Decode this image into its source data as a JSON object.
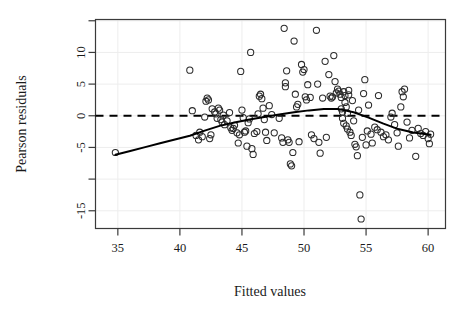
{
  "chart_data": {
    "type": "scatter",
    "title": "",
    "xlabel": "Fitted values",
    "ylabel": "Pearson residuals",
    "xlim": [
      33.2,
      61.4
    ],
    "ylim": [
      -17.8,
      15.2
    ],
    "xticks": [
      35,
      40,
      45,
      50,
      55,
      60
    ],
    "xtick_labels": [
      "35",
      "40",
      "45",
      "50",
      "55",
      "60"
    ],
    "yticks": [
      15,
      10,
      5,
      0,
      -5,
      -10,
      -15
    ],
    "ytick_labels": [
      "",
      "10",
      "5",
      "0",
      "-5",
      "",
      "-15"
    ],
    "grid": true,
    "legend": "none",
    "marker": "open-circle",
    "marker_color": "#2b2b2b",
    "reference_line": {
      "y": 0,
      "style": "dashed",
      "color": "#000000"
    },
    "smoother": {
      "name": "loess-smooth",
      "style": "solid",
      "color": "#000000",
      "x": [
        34.8,
        36.0,
        37.2,
        38.4,
        39.6,
        40.8,
        42.0,
        43.2,
        44.4,
        45.6,
        46.8,
        48.0,
        49.2,
        50.4,
        51.6,
        52.8,
        54.0,
        55.2,
        56.4,
        57.6,
        58.8,
        60.2
      ],
      "y": [
        -6.15,
        -5.55,
        -4.95,
        -4.35,
        -3.75,
        -3.15,
        -2.35,
        -1.6,
        -1.05,
        -0.6,
        -0.2,
        0.2,
        0.55,
        0.85,
        1.05,
        1.05,
        0.55,
        -0.3,
        -1.25,
        -2.1,
        -2.65,
        -3.0
      ]
    },
    "points": [
      [
        34.8,
        -5.8
      ],
      [
        40.8,
        7.2
      ],
      [
        41.0,
        0.8
      ],
      [
        41.3,
        -3.1
      ],
      [
        41.5,
        -3.8
      ],
      [
        41.6,
        -2.6
      ],
      [
        41.8,
        -3.3
      ],
      [
        42.0,
        -0.2
      ],
      [
        42.1,
        2.3
      ],
      [
        42.2,
        2.8
      ],
      [
        42.3,
        2.5
      ],
      [
        42.4,
        -3.6
      ],
      [
        42.5,
        -3.0
      ],
      [
        42.6,
        1.1
      ],
      [
        42.8,
        0.6
      ],
      [
        42.9,
        0.3
      ],
      [
        43.0,
        -0.4
      ],
      [
        43.1,
        1.2
      ],
      [
        43.2,
        0.9
      ],
      [
        43.3,
        -0.6
      ],
      [
        43.4,
        -1.0
      ],
      [
        43.5,
        0.1
      ],
      [
        43.6,
        -1.4
      ],
      [
        43.8,
        -0.8
      ],
      [
        44.0,
        0.5
      ],
      [
        44.1,
        -1.9
      ],
      [
        44.2,
        -2.3
      ],
      [
        44.3,
        -2.0
      ],
      [
        44.4,
        -1.5
      ],
      [
        44.6,
        -2.7
      ],
      [
        44.7,
        -4.3
      ],
      [
        44.8,
        -3.0
      ],
      [
        44.9,
        7.0
      ],
      [
        45.0,
        0.9
      ],
      [
        45.1,
        -0.3
      ],
      [
        45.2,
        -2.6
      ],
      [
        45.3,
        -2.4
      ],
      [
        45.4,
        -4.8
      ],
      [
        45.5,
        -1.1
      ],
      [
        45.6,
        -0.5
      ],
      [
        45.7,
        10.0
      ],
      [
        45.8,
        -5.2
      ],
      [
        45.9,
        -6.1
      ],
      [
        46.0,
        -2.8
      ],
      [
        46.2,
        -2.5
      ],
      [
        46.3,
        0.3
      ],
      [
        46.4,
        3.1
      ],
      [
        46.5,
        3.4
      ],
      [
        46.6,
        2.7
      ],
      [
        46.7,
        1.2
      ],
      [
        46.8,
        -0.6
      ],
      [
        46.9,
        -2.6
      ],
      [
        47.0,
        -3.9
      ],
      [
        47.2,
        1.6
      ],
      [
        47.4,
        0.2
      ],
      [
        47.6,
        -2.7
      ],
      [
        48.0,
        -0.4
      ],
      [
        48.2,
        -3.5
      ],
      [
        48.3,
        -4.2
      ],
      [
        48.4,
        13.8
      ],
      [
        48.5,
        5.2
      ],
      [
        48.5,
        4.6
      ],
      [
        48.6,
        7.1
      ],
      [
        48.7,
        -3.8
      ],
      [
        48.8,
        -4.2
      ],
      [
        48.9,
        -7.6
      ],
      [
        49.0,
        -7.9
      ],
      [
        49.1,
        -5.8
      ],
      [
        49.2,
        11.8
      ],
      [
        49.3,
        3.4
      ],
      [
        49.4,
        1.4
      ],
      [
        49.5,
        1.8
      ],
      [
        49.6,
        -4.1
      ],
      [
        49.8,
        8.1
      ],
      [
        49.9,
        6.9
      ],
      [
        50.0,
        7.3
      ],
      [
        50.1,
        3.0
      ],
      [
        50.2,
        2.5
      ],
      [
        50.3,
        4.9
      ],
      [
        50.5,
        2.9
      ],
      [
        50.6,
        -3.0
      ],
      [
        50.8,
        -3.6
      ],
      [
        51.0,
        13.5
      ],
      [
        51.1,
        5.0
      ],
      [
        51.2,
        -4.2
      ],
      [
        51.3,
        -5.9
      ],
      [
        51.5,
        2.8
      ],
      [
        51.7,
        8.6
      ],
      [
        51.8,
        -3.4
      ],
      [
        52.0,
        6.5
      ],
      [
        52.1,
        3.1
      ],
      [
        52.2,
        2.8
      ],
      [
        52.3,
        3.0
      ],
      [
        52.4,
        9.5
      ],
      [
        52.5,
        5.4
      ],
      [
        52.6,
        3.6
      ],
      [
        52.7,
        4.2
      ],
      [
        52.8,
        3.9
      ],
      [
        52.9,
        3.4
      ],
      [
        53.0,
        2.9
      ],
      [
        53.0,
        1.1
      ],
      [
        53.1,
        0.6
      ],
      [
        53.1,
        -0.4
      ],
      [
        53.2,
        -1.2
      ],
      [
        53.2,
        3.8
      ],
      [
        53.3,
        3.2
      ],
      [
        53.3,
        2.1
      ],
      [
        53.4,
        1.4
      ],
      [
        53.4,
        -1.6
      ],
      [
        53.5,
        -2.1
      ],
      [
        53.5,
        0.4
      ],
      [
        53.6,
        4.0
      ],
      [
        53.6,
        3.3
      ],
      [
        53.7,
        -2.6
      ],
      [
        53.8,
        -3.1
      ],
      [
        53.9,
        2.4
      ],
      [
        54.0,
        -0.8
      ],
      [
        54.1,
        -4.5
      ],
      [
        54.2,
        -4.9
      ],
      [
        54.3,
        -6.3
      ],
      [
        54.4,
        0.9
      ],
      [
        54.5,
        -12.5
      ],
      [
        54.6,
        -16.3
      ],
      [
        54.7,
        -3.4
      ],
      [
        54.8,
        3.5
      ],
      [
        54.9,
        5.7
      ],
      [
        55.0,
        -4.6
      ],
      [
        55.1,
        -2.4
      ],
      [
        55.2,
        1.7
      ],
      [
        55.4,
        -2.9
      ],
      [
        55.5,
        -4.3
      ],
      [
        55.7,
        -1.8
      ],
      [
        55.9,
        -2.2
      ],
      [
        56.0,
        3.2
      ],
      [
        56.2,
        -2.6
      ],
      [
        56.4,
        -3.3
      ],
      [
        56.6,
        -3.0
      ],
      [
        56.8,
        -3.8
      ],
      [
        57.0,
        -0.2
      ],
      [
        57.1,
        0.4
      ],
      [
        57.3,
        -1.4
      ],
      [
        57.5,
        -2.7
      ],
      [
        57.6,
        -4.8
      ],
      [
        57.8,
        1.4
      ],
      [
        57.9,
        3.8
      ],
      [
        58.0,
        3.0
      ],
      [
        58.1,
        4.2
      ],
      [
        58.3,
        -1.0
      ],
      [
        58.5,
        -3.5
      ],
      [
        58.7,
        -2.3
      ],
      [
        59.0,
        -6.4
      ],
      [
        59.2,
        -2.0
      ],
      [
        59.4,
        -2.8
      ],
      [
        59.6,
        -3.1
      ],
      [
        59.8,
        -2.5
      ],
      [
        60.0,
        -3.6
      ],
      [
        60.1,
        -4.4
      ],
      [
        60.2,
        -2.9
      ]
    ]
  }
}
